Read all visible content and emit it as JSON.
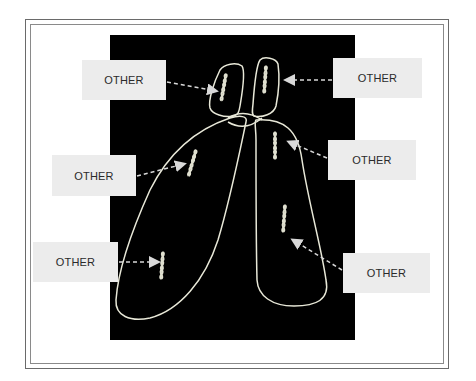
{
  "diagram": {
    "type": "chromosome-labeling",
    "background_color": "#000000",
    "outline_color": "#e8e8d8",
    "label_box_color": "#ececec",
    "labels": [
      {
        "id": "top-left",
        "text": "OTHER"
      },
      {
        "id": "top-right",
        "text": "OTHER"
      },
      {
        "id": "middle-left",
        "text": "OTHER"
      },
      {
        "id": "middle-right",
        "text": "OTHER"
      },
      {
        "id": "bottom-left",
        "text": "OTHER"
      },
      {
        "id": "bottom-right",
        "text": "OTHER"
      }
    ]
  }
}
